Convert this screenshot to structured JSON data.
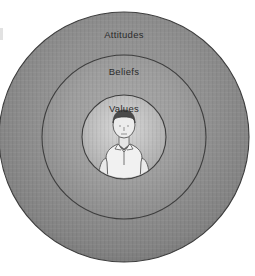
{
  "diagram": {
    "type": "concentric-circles",
    "background_color": "#ffffff",
    "center": {
      "x": 124,
      "y": 137
    },
    "rings": [
      {
        "id": "attitudes",
        "label": "Attitudes",
        "level": 3,
        "radius": 125,
        "label_x": 124,
        "label_y": 38,
        "fill_color": "#8e8e8e",
        "rim_color": "#7a7a7a",
        "stroke_color": "#3d3d3d"
      },
      {
        "id": "beliefs",
        "label": "Beliefs",
        "level": 2,
        "radius": 82,
        "label_x": 124,
        "label_y": 75,
        "fill_color": "#9a9a9a",
        "rim_color": "#8a8a8a",
        "stroke_color": "#3d3d3d"
      },
      {
        "id": "values",
        "label": "Values",
        "level": 1,
        "radius": 42,
        "label_x": 124,
        "label_y": 112,
        "fill_color": "#b5b5b5",
        "rim_color": "#a2a2a2",
        "stroke_color": "#3d3d3d"
      }
    ],
    "center_figure": {
      "name": "person-illustration",
      "description": "Line drawing of a person with dark hair wearing a light collared polo shirt",
      "hair_color": "#4a4a4a",
      "shirt_color": "#efefef",
      "line_color": "#4f4f4f"
    },
    "texture": {
      "style": "vertical-stripes",
      "opacity": 0.06
    }
  }
}
